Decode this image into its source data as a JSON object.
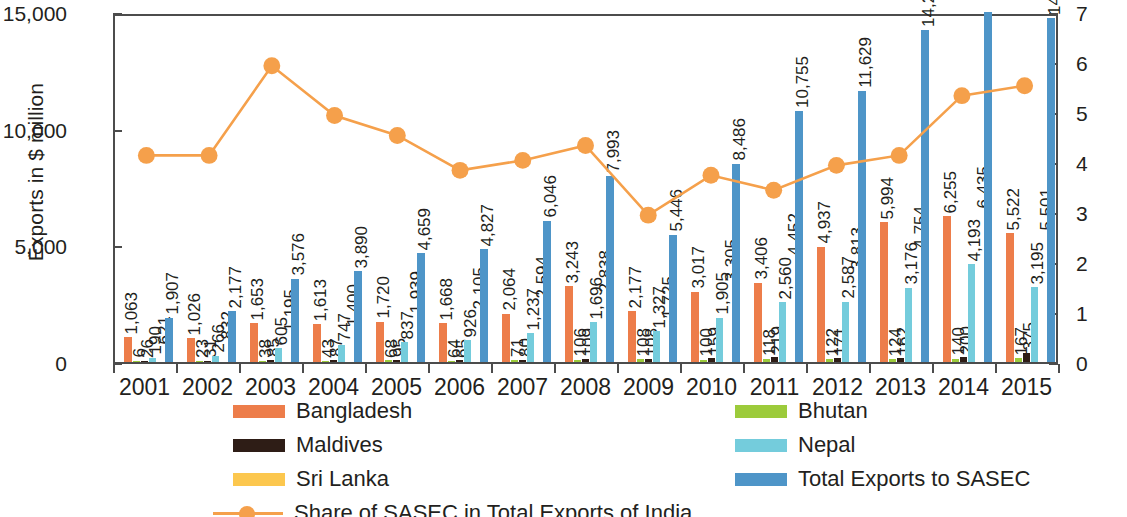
{
  "chart_data": {
    "type": "bar",
    "title": "",
    "subtitle": "",
    "ylabel": "Exports in $ million",
    "ylabel_right": "% Share of SASEC in Total Exports of india",
    "xlabel": "",
    "categories": [
      "2001",
      "2002",
      "2003",
      "2004",
      "2005",
      "2006",
      "2007",
      "2008",
      "2009",
      "2010",
      "2011",
      "2012",
      "2013",
      "2014",
      "2015"
    ],
    "ylim": [
      0,
      15000
    ],
    "yticks": [
      "0",
      "5,000",
      "10,000",
      "15,000"
    ],
    "ytick_values": [
      0,
      5000,
      10000,
      15000
    ],
    "ylim_right": [
      0,
      7
    ],
    "yticks_right": [
      "0",
      "1",
      "2",
      "3",
      "4",
      "5",
      "6",
      "7"
    ],
    "ytick_values_right": [
      0,
      1,
      2,
      3,
      4,
      5,
      6,
      7
    ],
    "grid": false,
    "legend_position": "bottom",
    "series": [
      {
        "name": "Bangladesh",
        "color": "#ed7d4a",
        "axis": "left",
        "values": [
          1063,
          1026,
          1653,
          1613,
          1720,
          1668,
          2064,
          3243,
          2177,
          3017,
          3406,
          4937,
          5994,
          6255,
          5522
        ],
        "labels": [
          "1,063",
          "1,026",
          "1,653",
          "1,613",
          "1,720",
          "1,668",
          "2,064",
          "3,243",
          "2,177",
          "3,017",
          "3,406",
          "4,937",
          "5,994",
          "6,255",
          "5,522"
        ]
      },
      {
        "name": "Bhutan",
        "color": "#9ccb3b",
        "axis": "left",
        "values": [
          6,
          23,
          38,
          43,
          68,
          64,
          71,
          106,
          108,
          100,
          118,
          122,
          124,
          140,
          167
        ],
        "labels": [
          "6",
          "23",
          "38",
          "43",
          "68",
          "64",
          "71",
          "106",
          "108",
          "100",
          "118",
          "122",
          "124",
          "140",
          "167"
        ]
      },
      {
        "name": "Maldives",
        "color": "#2e1d16",
        "axis": "left",
        "values": [
          26,
          31,
          85,
          87,
          95,
          65,
          80,
          109,
          108,
          159,
          219,
          171,
          162,
          200,
          375
        ],
        "labels": [
          "26",
          "31",
          "85",
          "87",
          "95",
          "65",
          "80",
          "109",
          "108",
          "159",
          "219",
          "171",
          "162",
          "200",
          "375"
        ]
      },
      {
        "name": "Nepal",
        "color": "#74ccdc",
        "axis": "left",
        "values": [
          190,
          266,
          605,
          747,
          837,
          926,
          1237,
          1696,
          1327,
          1905,
          2560,
          2587,
          3176,
          4193,
          3195
        ],
        "labels": [
          "190",
          "266",
          "605",
          "747",
          "837",
          "926",
          "1,237",
          "1,696",
          "1,327",
          "1,905",
          "2,560",
          "2,587",
          "3,176",
          "4,193",
          "3,195"
        ]
      },
      {
        "name": "Sri Lanka",
        "color": "#fcc council",
        "axis": "left",
        "values": [
          621,
          832,
          1195,
          1400,
          1939,
          2105,
          2594,
          2838,
          1725,
          3305,
          4452,
          3813,
          4754,
          6435,
          5501
        ],
        "labels": [
          "621",
          "832",
          "1,195",
          "1,400",
          "1,939",
          "2,105",
          "2,594",
          "2,838",
          "1,725",
          "3,305",
          "4,452",
          "3,813",
          "4,754",
          "6,435",
          "5,501"
        ]
      },
      {
        "name": "Total Exports to SASEC",
        "color": "#4e95c8",
        "axis": "left",
        "values": [
          1907,
          2177,
          3576,
          3890,
          4659,
          4827,
          6046,
          7993,
          5446,
          8486,
          10755,
          11629,
          14210,
          17223,
          14760
        ],
        "labels": [
          "1,907",
          "2,177",
          "3,576",
          "3,890",
          "4,659",
          "4,827",
          "6,046",
          "7,993",
          "5,446",
          "8,486",
          "10,755",
          "11,629",
          "14,210",
          "",
          "14,760"
        ]
      },
      {
        "name": "Share of SASEC in Total Exports of India",
        "color": "#f5a04b",
        "axis": "right",
        "type": "line",
        "values": [
          4.2,
          4.2,
          6.0,
          5.0,
          4.6,
          3.9,
          4.1,
          4.4,
          3.0,
          3.8,
          3.5,
          4.0,
          4.2,
          5.4,
          5.6
        ],
        "labels": []
      }
    ]
  },
  "legend": {
    "items": [
      {
        "label": "Bangladesh",
        "color": "#ed7d4a",
        "kind": "bar"
      },
      {
        "label": "Bhutan",
        "color": "#9ccb3b",
        "kind": "bar"
      },
      {
        "label": "Maldives",
        "color": "#2e1d16",
        "kind": "bar"
      },
      {
        "label": "Nepal",
        "color": "#74ccdc",
        "kind": "bar"
      },
      {
        "label": "Sri Lanka",
        "color": "#fcc74e",
        "kind": "bar"
      },
      {
        "label": "Total Exports to SASEC",
        "color": "#4e95c8",
        "kind": "bar"
      },
      {
        "label": "Share of SASEC in Total Exports of India",
        "color": "#f5a04b",
        "kind": "line"
      }
    ]
  },
  "colors": {
    "bangladesh": "#ed7d4a",
    "bhutan": "#9ccb3b",
    "maldives": "#2e1d16",
    "nepal": "#74ccdc",
    "srilanka": "#fcc74e",
    "total": "#4e95c8",
    "share_line": "#f5a04b",
    "axis": "#4c4c4c",
    "text": "#231f20"
  }
}
